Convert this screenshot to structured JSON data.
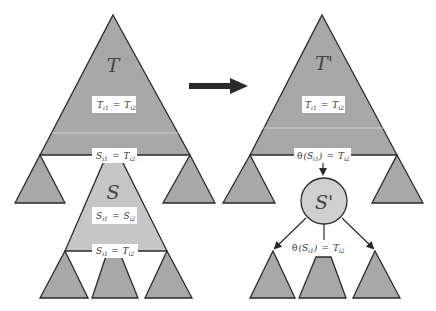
{
  "diagram": {
    "colors": {
      "dark_gray": "#a4a4a4",
      "light_gray": "#c8c8c8",
      "stroke": "#2a2a2a",
      "label_bg": "#ffffff",
      "arrow": "#2a2a2a"
    },
    "left": {
      "tree_T": {
        "name": "T",
        "inner_label": {
          "lhs": "T",
          "lhs_sub": "i1",
          "op": "=",
          "rhs": "T",
          "rhs_sub": "i2"
        },
        "boundary_label": {
          "lhs": "S",
          "lhs_sub": "i1",
          "op": "=",
          "rhs": "T",
          "rhs_sub": "i2"
        }
      },
      "tree_S": {
        "name": "S",
        "inner_label": {
          "lhs": "S",
          "lhs_sub": "i1",
          "op": "=",
          "rhs": "S",
          "rhs_sub": "i2"
        },
        "boundary_label": {
          "lhs": "S",
          "lhs_sub": "i1",
          "op": "=",
          "rhs": "T",
          "rhs_sub": "i2"
        }
      }
    },
    "right": {
      "tree_T_prime": {
        "name": "T'",
        "inner_label": {
          "lhs": "T",
          "lhs_sub": "i1",
          "op": "=",
          "rhs": "T",
          "rhs_sub": "i2"
        },
        "boundary_label": {
          "fn": "θ",
          "arg": "S",
          "arg_sub": "i1",
          "op": "=",
          "rhs": "T",
          "rhs_sub": "i2"
        }
      },
      "node_S_prime": {
        "name": "S'",
        "child_label": {
          "fn": "θ",
          "arg": "S",
          "arg_sub": "i1",
          "op": "=",
          "rhs": "T",
          "rhs_sub": "i2"
        }
      }
    },
    "transform_arrow": "right-arrow"
  }
}
